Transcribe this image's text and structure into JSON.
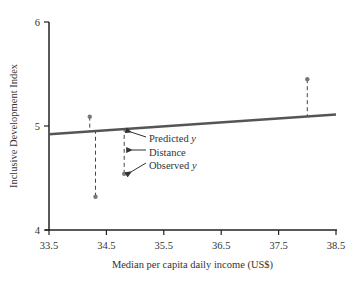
{
  "chart_data": {
    "type": "scatter",
    "title": "",
    "xlabel": "Median per capita daily income (US$)",
    "ylabel": "Inclusive Development Index",
    "xlim": [
      33.5,
      38.5
    ],
    "ylim": [
      4,
      6
    ],
    "xticks": [
      "33.5",
      "34.5",
      "35.5",
      "36.5",
      "37.5",
      "38.5"
    ],
    "xtick_values": [
      33.5,
      34.5,
      35.5,
      36.5,
      37.5,
      38.5
    ],
    "yticks": [
      "4",
      "5",
      "6"
    ],
    "ytick_values": [
      4,
      5,
      6
    ],
    "grid": false,
    "points": [
      {
        "x": 34.21,
        "y": 5.09
      },
      {
        "x": 34.31,
        "y": 4.32
      },
      {
        "x": 34.81,
        "y": 4.54
      },
      {
        "x": 38.0,
        "y": 5.45
      }
    ],
    "regression_line": {
      "x": [
        33.5,
        38.5
      ],
      "y": [
        4.92,
        5.11
      ]
    },
    "residuals_shown": true,
    "annotations": [
      {
        "text": "Predicted ",
        "italic": "y",
        "target": "predicted-value"
      },
      {
        "text": "Distance",
        "italic": "",
        "target": "residual"
      },
      {
        "text": "Observed ",
        "italic": "y",
        "target": "observed-value"
      }
    ],
    "colors": {
      "axis": "#222222",
      "regression_line": "#555555",
      "points": "#777777",
      "residual_lines": "#444444"
    }
  }
}
